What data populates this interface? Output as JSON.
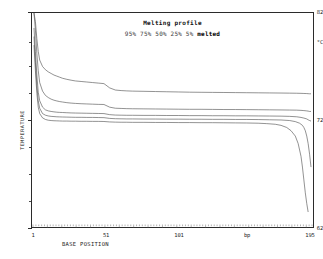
{
  "chart_data": {
    "type": "line",
    "title": "Melting profile",
    "xlabel": "BASE POSITION",
    "ylabel": "TEMPERATURE",
    "unit_label": "°C",
    "bp_label": "bp",
    "xlim": [
      1,
      195
    ],
    "ylim": [
      62,
      82
    ],
    "yticks": [
      62,
      72,
      82
    ],
    "ytick_labels": [
      "62",
      "72",
      "82"
    ],
    "xticks": [
      1,
      51,
      101,
      195
    ],
    "xtick_labels": [
      "1",
      "51",
      "101",
      "195"
    ],
    "grid": false,
    "legend_position": "top-center",
    "legend_entries": [
      "95%",
      "75%",
      "50%",
      "25%",
      "5%"
    ],
    "legend_suffix": "melted",
    "series": [
      {
        "name": "95% melted",
        "x": [
          1,
          2,
          3,
          4,
          5,
          7,
          9,
          11,
          13,
          15,
          17,
          19,
          21,
          24,
          27,
          30,
          34,
          38,
          42,
          46,
          50,
          54,
          58,
          62,
          66,
          70,
          78,
          86,
          94,
          102,
          110,
          118,
          126,
          134,
          142,
          150,
          158,
          166,
          174,
          180,
          185,
          188,
          190,
          192,
          193,
          194,
          195
        ],
        "values": [
          82.0,
          81.2,
          79.6,
          78.4,
          77.6,
          77.0,
          76.7,
          76.5,
          76.35,
          76.2,
          76.1,
          76.0,
          75.9,
          75.8,
          75.72,
          75.65,
          75.6,
          75.55,
          75.5,
          75.45,
          75.4,
          75.0,
          74.8,
          74.75,
          74.72,
          74.7,
          74.68,
          74.66,
          74.64,
          74.62,
          74.6,
          74.59,
          74.58,
          74.57,
          74.56,
          74.55,
          74.54,
          74.53,
          74.52,
          74.51,
          74.5,
          74.49,
          74.48,
          74.47,
          74.46,
          74.45,
          74.45
        ]
      },
      {
        "name": "75% melted",
        "x": [
          1,
          2,
          3,
          4,
          5,
          7,
          9,
          11,
          13,
          15,
          17,
          19,
          21,
          24,
          27,
          30,
          34,
          38,
          42,
          46,
          50,
          54,
          58,
          62,
          66,
          70,
          78,
          86,
          94,
          102,
          110,
          118,
          126,
          134,
          142,
          150,
          158,
          166,
          174,
          180,
          185,
          188,
          190,
          192,
          193,
          194,
          195
        ],
        "values": [
          82.0,
          80.4,
          78.2,
          76.6,
          75.5,
          74.7,
          74.3,
          74.1,
          73.95,
          73.85,
          73.78,
          73.72,
          73.68,
          73.62,
          73.58,
          73.55,
          73.52,
          73.5,
          73.48,
          73.46,
          73.45,
          73.2,
          73.1,
          73.08,
          73.06,
          73.05,
          73.04,
          73.03,
          73.02,
          73.01,
          73.0,
          73.0,
          72.99,
          72.98,
          72.98,
          72.97,
          72.96,
          72.95,
          72.94,
          72.93,
          72.92,
          72.9,
          72.88,
          72.85,
          72.83,
          72.8,
          72.8
        ]
      },
      {
        "name": "50% melted",
        "x": [
          1,
          2,
          3,
          4,
          5,
          7,
          9,
          11,
          13,
          15,
          17,
          19,
          21,
          24,
          27,
          30,
          34,
          38,
          42,
          46,
          50,
          54,
          58,
          62,
          66,
          70,
          78,
          86,
          94,
          102,
          110,
          118,
          126,
          134,
          142,
          150,
          158,
          166,
          174,
          180,
          185,
          188,
          190,
          192,
          193,
          194,
          195
        ],
        "values": [
          80.6,
          78.4,
          76.2,
          74.6,
          73.8,
          73.2,
          72.95,
          72.85,
          72.8,
          72.76,
          72.73,
          72.71,
          72.7,
          72.68,
          72.66,
          72.65,
          72.64,
          72.63,
          72.62,
          72.61,
          72.6,
          72.5,
          72.46,
          72.45,
          72.44,
          72.44,
          72.43,
          72.43,
          72.42,
          72.42,
          72.41,
          72.41,
          72.4,
          72.4,
          72.39,
          72.39,
          72.38,
          72.37,
          72.36,
          72.34,
          72.3,
          72.24,
          72.18,
          72.1,
          72.02,
          71.95,
          71.9
        ]
      },
      {
        "name": "25% melted",
        "x": [
          1,
          2,
          3,
          4,
          5,
          7,
          9,
          11,
          13,
          15,
          17,
          19,
          21,
          24,
          27,
          30,
          34,
          38,
          42,
          46,
          50,
          54,
          58,
          62,
          66,
          70,
          78,
          86,
          94,
          102,
          110,
          118,
          126,
          134,
          142,
          150,
          158,
          166,
          174,
          180,
          184,
          187,
          189,
          190,
          191,
          192,
          193,
          194,
          195
        ],
        "values": [
          79.8,
          77.4,
          75.2,
          73.8,
          73.1,
          72.6,
          72.45,
          72.38,
          72.34,
          72.32,
          72.3,
          72.29,
          72.28,
          72.27,
          72.26,
          72.25,
          72.25,
          72.24,
          72.24,
          72.23,
          72.22,
          72.15,
          72.12,
          72.11,
          72.1,
          72.1,
          72.09,
          72.09,
          72.08,
          72.08,
          72.07,
          72.07,
          72.06,
          72.06,
          72.05,
          72.05,
          72.04,
          72.02,
          72.0,
          71.95,
          71.85,
          71.7,
          71.5,
          71.3,
          71.0,
          70.5,
          69.8,
          68.8,
          67.6
        ]
      },
      {
        "name": "5% melted",
        "x": [
          1,
          2,
          3,
          4,
          5,
          7,
          9,
          11,
          13,
          15,
          17,
          19,
          21,
          24,
          27,
          30,
          34,
          38,
          42,
          46,
          50,
          54,
          58,
          62,
          66,
          70,
          78,
          86,
          94,
          102,
          110,
          118,
          126,
          134,
          142,
          150,
          158,
          164,
          170,
          174,
          178,
          181,
          184,
          186,
          188,
          189,
          190,
          191,
          192,
          193
        ],
        "values": [
          79.0,
          76.6,
          74.5,
          73.2,
          72.6,
          72.2,
          72.05,
          71.98,
          71.95,
          71.93,
          71.92,
          71.91,
          71.9,
          71.9,
          71.89,
          71.89,
          71.88,
          71.88,
          71.87,
          71.87,
          71.86,
          71.82,
          71.8,
          71.79,
          71.79,
          71.78,
          71.78,
          71.77,
          71.77,
          71.76,
          71.76,
          71.75,
          71.75,
          71.74,
          71.73,
          71.72,
          71.7,
          71.66,
          71.6,
          71.5,
          71.3,
          71.0,
          70.5,
          69.8,
          68.6,
          67.6,
          66.4,
          65.2,
          64.2,
          63.4
        ]
      }
    ]
  }
}
